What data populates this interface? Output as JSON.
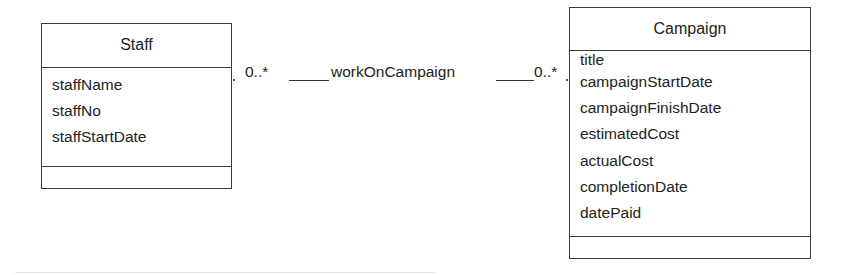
{
  "diagram": {
    "type": "UML class diagram",
    "classes": [
      {
        "name": "Staff",
        "attributes": [
          "staffName",
          "staffNo",
          "staffStartDate"
        ],
        "operations": []
      },
      {
        "name": "Campaign",
        "attributes": [
          "title",
          "campaignStartDate",
          "campaignFinishDate",
          "estimatedCost",
          "actualCost",
          "completionDate",
          "datePaid"
        ],
        "operations": []
      }
    ],
    "association": {
      "name": "workOnCampaign",
      "source": "Staff",
      "target": "Campaign",
      "source_multiplicity": "0..*",
      "target_multiplicity": "0..*"
    }
  }
}
